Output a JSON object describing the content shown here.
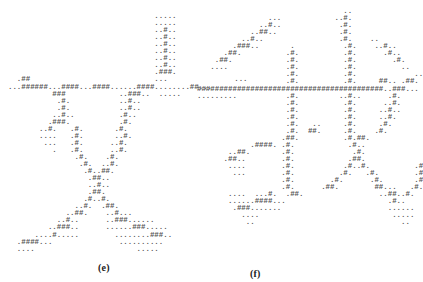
{
  "figure": {
    "panels": [
      {
        "id": "e",
        "caption": "(e)",
        "character": "文",
        "rows": [
          "",
          "                                 .....",
          "                                 .....",
          "                                 ..#..",
          "                                 ..#..",
          "                                 ..#..",
          "                                 ..#..",
          "                                 ..#..",
          "                                 ..#..",
          "                                 .###.",
          "  .##                            ...               ...",
          "...######...####...####......####........##...",
          "          ###            ..###..  .....",
          "           .#.           ..#..",
          "           .#.           ..#..",
          "          ..#..          .#..",
          "         .###.           .#.",
          "       ..#.   .#.       .#.",
          "       ....   .#.       ..#.",
          "        ...   .#.      ..#.",
          "          .   .#.      ..#.",
          "               .#.    .#.",
          "                .#.  ..#.",
          "                 .#..##.",
          "                  .##..",
          "                  ..#..",
          "                  .##.",
          "                 .#..#.",
          "               ..#.  .##.",
          "             ..##.    ..#...",
          "           ..#..      ..###......",
          "         ..###..      ......###.....",
          "      ....#.....        ........###..",
          "  .####...               ..........",
          "  ....                       ....."
        ]
      },
      {
        "id": "f",
        "caption": "(f)",
        "character": "我",
        "rows": [
          "                                 ..",
          "                ...            ..#.",
          "              ..#..             .#.",
          "            ..##..              .#.",
          "          ..#..                 .#.    ..",
          "        .###..       .           .#.    ..#..",
          "      .##.          .#.          .#.      .#..",
          "    .##.            .#.          .#.        .#.",
          "   ....             .#.          .#.          ..",
          "                    .#.          .#.             ..",
          "                    .#.          .#.     ##.. .##.",
          "##########################################..###...",
          ".........           .#.         ..#..      .#.",
          "                    .#.          .#.      ..#.",
          "                    .#.          .#.     ..#..",
          "                    .#.          .#.     ..#.",
          "                    .#.   ..     .#.     .#.",
          "                    .#.  ##.     .#.    .#.",
          "                   .##.          .#.##.",
          "            .####. .#.            .#..",
          "       ..##.       .#.             .#.",
          "      .##..        .#.            .##.",
          "       ....        .#.           .#..#.          .#",
          "        ...        .#.          .#.   .#.        .#",
          "                   .#.        .#.      .#.       .#",
          "                   .#.      .##.        ##...   .#.",
          "       ....  ...#.  .##.                 ..##..#.",
          "       ......####...                       .#..",
          "        .###.......                        ......",
          "          ....                              .....",
          "           ..                                 .."
        ]
      }
    ]
  }
}
